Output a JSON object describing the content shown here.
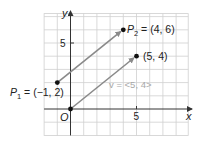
{
  "diagram": {
    "type": "vector-plane",
    "axes": {
      "x_label": "x",
      "y_label": "y",
      "origin_label": "O",
      "x_tick_label": "5",
      "y_tick_label": "5"
    },
    "points": {
      "p1": {
        "label": "P",
        "subscript": "1",
        "text": " = (−1, 2)",
        "x": -1,
        "y": 2
      },
      "p2": {
        "label": "P",
        "subscript": "2",
        "text": " = (4, 6)",
        "x": 4,
        "y": 6
      },
      "origin": {
        "x": 0,
        "y": 0
      },
      "tip": {
        "text": "(5, 4)",
        "x": 5,
        "y": 4
      }
    },
    "vector_label": "v = <5, 4>",
    "vectors": [
      {
        "from": [
          -1,
          2
        ],
        "to": [
          4,
          6
        ]
      },
      {
        "from": [
          0,
          0
        ],
        "to": [
          5,
          4
        ]
      }
    ],
    "colors": {
      "grid": "#cfcfcf",
      "axis": "#333333",
      "vector": "#8a8a8a",
      "point": "#111111",
      "vector_label": "#a8a8a8"
    }
  }
}
